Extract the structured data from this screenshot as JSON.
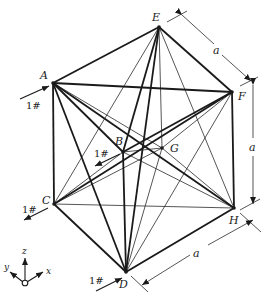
{
  "figure": {
    "type": "space-truss-cube",
    "nodes": {
      "A": [
        53,
        83
      ],
      "B": [
        123,
        152
      ],
      "C": [
        54,
        204
      ],
      "D": [
        126,
        272
      ],
      "E": [
        159,
        27
      ],
      "F": [
        232,
        92
      ],
      "G": [
        162,
        148
      ],
      "H": [
        234,
        208
      ]
    },
    "node_labels": {
      "A": "A",
      "B": "B",
      "C": "C",
      "D": "D",
      "E": "E",
      "F": "F",
      "G": "G",
      "H": "H"
    },
    "thick_members": [
      [
        "A",
        "E"
      ],
      [
        "E",
        "F"
      ],
      [
        "A",
        "F"
      ],
      [
        "A",
        "C"
      ],
      [
        "F",
        "H"
      ],
      [
        "C",
        "D"
      ],
      [
        "D",
        "H"
      ],
      [
        "A",
        "B"
      ],
      [
        "A",
        "D"
      ],
      [
        "E",
        "D"
      ],
      [
        "B",
        "F"
      ],
      [
        "B",
        "D"
      ],
      [
        "E",
        "B"
      ],
      [
        "A",
        "H"
      ],
      [
        "C",
        "F"
      ]
    ],
    "thin_members": [
      [
        "E",
        "G"
      ],
      [
        "G",
        "D"
      ],
      [
        "E",
        "C"
      ],
      [
        "E",
        "H"
      ],
      [
        "A",
        "G"
      ],
      [
        "C",
        "H"
      ],
      [
        "C",
        "G"
      ],
      [
        "B",
        "G"
      ],
      [
        "G",
        "H"
      ],
      [
        "B",
        "H"
      ],
      [
        "F",
        "D"
      ],
      [
        "F",
        "G"
      ],
      [
        "C",
        "B"
      ]
    ],
    "loads": [
      {
        "node": "A",
        "label": "1#"
      },
      {
        "node": "B",
        "label": "1#"
      },
      {
        "node": "C",
        "label": "1#"
      },
      {
        "node": "D",
        "label": "1#"
      }
    ],
    "dimensions": [
      {
        "label": "a",
        "between": "E-F"
      },
      {
        "label": "a",
        "between": "F-H"
      },
      {
        "label": "a",
        "between": "D-H"
      }
    ],
    "axes": {
      "x": "x",
      "y": "y",
      "z": "z"
    }
  }
}
